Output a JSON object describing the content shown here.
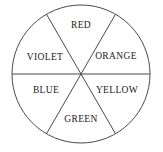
{
  "diagram": {
    "type": "color-wheel",
    "background_color": "#ffffff",
    "stroke_color": "#4a4a4a",
    "text_color": "#1a1a1a",
    "circle": {
      "center_x": 81,
      "center_y": 74,
      "radius": 69
    },
    "divider_count": 3,
    "sector_count": 6,
    "sectors": [
      {
        "label": "RED",
        "angle_deg": 90,
        "label_x": 81,
        "label_y": 26
      },
      {
        "label": "ORANGE",
        "angle_deg": 30,
        "label_x": 116,
        "label_y": 57
      },
      {
        "label": "YELLOW",
        "angle_deg": 330,
        "label_x": 117,
        "label_y": 91
      },
      {
        "label": "GREEN",
        "angle_deg": 270,
        "label_x": 81,
        "label_y": 120
      },
      {
        "label": "BLUE",
        "angle_deg": 210,
        "label_x": 46,
        "label_y": 91
      },
      {
        "label": "VIOLET",
        "angle_deg": 150,
        "label_x": 45,
        "label_y": 58
      }
    ]
  }
}
